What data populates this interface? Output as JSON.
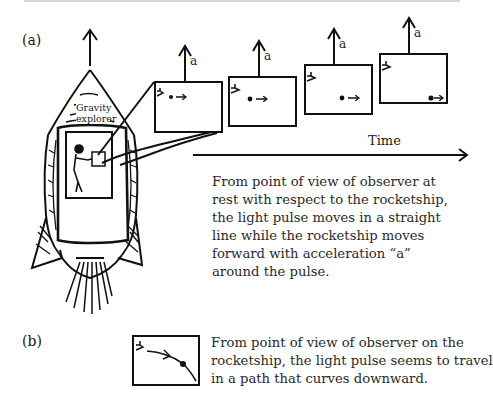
{
  "figure": {
    "part_a_label": "(a)",
    "part_b_label": "(b)",
    "rocket_label_line1": "Gravity",
    "rocket_label_line2": "explorer",
    "acceleration_label": "a",
    "time_axis_label": "Time",
    "frames": [
      {
        "index": 1,
        "pulse_position": "near-left",
        "label": "a"
      },
      {
        "index": 2,
        "pulse_position": "left-center",
        "label": "a"
      },
      {
        "index": 3,
        "pulse_position": "center-right",
        "label": "a"
      },
      {
        "index": 4,
        "pulse_position": "bottom-right",
        "label": "a"
      }
    ],
    "caption_a": [
      "From point of view of observer at",
      "rest with respect to the rocketship,",
      "the light pulse moves in a straight",
      "line while the rocketship moves",
      "forward with acceleration “a”",
      "around the pulse."
    ],
    "caption_b": [
      "From point of view of observer on the",
      "rocketship, the light pulse seems to travel",
      "in a path that curves downward."
    ]
  }
}
